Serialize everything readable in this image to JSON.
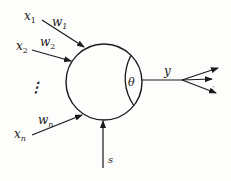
{
  "diagram": {
    "type": "neuron-model",
    "colors": {
      "stroke": "#1a1a1a",
      "background": "#fdfdfc"
    },
    "inputs": [
      {
        "name": "x",
        "sub": "1",
        "weight": "w",
        "weight_sub": "1"
      },
      {
        "name": "x",
        "sub": "2",
        "weight": "w",
        "weight_sub": "2"
      },
      {
        "name": "x",
        "sub": "n",
        "weight": "w",
        "weight_sub": "n"
      }
    ],
    "ellipsis": "⋮",
    "threshold": "θ",
    "output": "y",
    "output_ellipsis": "⋮",
    "external_input": "s"
  }
}
